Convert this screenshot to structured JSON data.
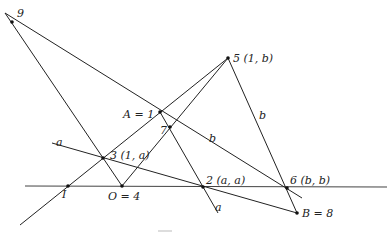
{
  "diagram": {
    "points": [
      {
        "id": "p9",
        "label": "9",
        "x": 12,
        "y": 22,
        "lx": 17,
        "ly": 17
      },
      {
        "id": "pA",
        "label": "A = 1",
        "x": 160,
        "y": 112,
        "lx": 123,
        "ly": 118
      },
      {
        "id": "p7",
        "label": "7",
        "x": 170,
        "y": 127,
        "lx": 160,
        "ly": 134
      },
      {
        "id": "p5",
        "label": "5 (1, b)",
        "x": 228,
        "y": 58,
        "lx": 233,
        "ly": 62
      },
      {
        "id": "p3",
        "label": "3 (1, a)",
        "x": 103,
        "y": 158,
        "lx": 110,
        "ly": 159
      },
      {
        "id": "pI",
        "label": "I",
        "x": 68,
        "y": 186,
        "lx": 62,
        "ly": 198
      },
      {
        "id": "pO",
        "label": "O = 4",
        "x": 122,
        "y": 186,
        "lx": 108,
        "ly": 200
      },
      {
        "id": "p2",
        "label": "2 (a, a)",
        "x": 203,
        "y": 187,
        "lx": 206,
        "ly": 184
      },
      {
        "id": "p6",
        "label": "6 (b, b)",
        "x": 287,
        "y": 188,
        "lx": 290,
        "ly": 184
      },
      {
        "id": "pB",
        "label": "B = 8",
        "x": 297,
        "y": 213,
        "lx": 302,
        "ly": 217
      }
    ],
    "line_labels": [
      {
        "id": "la1",
        "text": "a",
        "x": 56,
        "y": 146
      },
      {
        "id": "la2",
        "text": "a",
        "x": 215,
        "y": 211
      },
      {
        "id": "lb1",
        "text": "b",
        "x": 209,
        "y": 142
      },
      {
        "id": "lb2",
        "text": "b",
        "x": 259,
        "y": 119
      }
    ],
    "lines": [
      {
        "id": "axis",
        "x1": 25,
        "y1": 186,
        "x2": 387,
        "y2": 187
      },
      {
        "id": "diag-I-5",
        "x1": 20,
        "y1": 225,
        "x2": 228,
        "y2": 58
      },
      {
        "id": "line-a-3-B",
        "x1": 52,
        "y1": 143,
        "x2": 297,
        "y2": 213
      },
      {
        "id": "line-9-6",
        "x1": 5,
        "y1": 13,
        "x2": 302,
        "y2": 198
      },
      {
        "id": "line-9-O",
        "x1": 5,
        "y1": 13,
        "x2": 122,
        "y2": 186
      },
      {
        "id": "line-O-5",
        "x1": 122,
        "y1": 186,
        "x2": 228,
        "y2": 58
      },
      {
        "id": "line-5-B",
        "x1": 228,
        "y1": 58,
        "x2": 297,
        "y2": 213
      },
      {
        "id": "line-A-a",
        "x1": 160,
        "y1": 112,
        "x2": 218,
        "y2": 213
      }
    ],
    "footer_mark": "—"
  }
}
